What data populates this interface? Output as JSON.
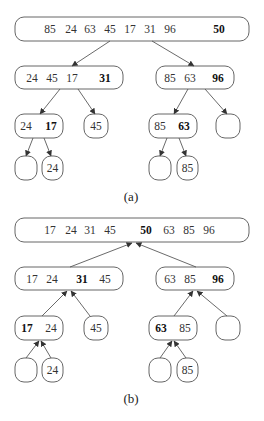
{
  "figure": {
    "type": "quick-sort-tree",
    "panels": [
      {
        "caption": "(a)",
        "direction": "down",
        "nodes": [
          {
            "id": "a-root",
            "box": [
              15,
              17,
              234,
              24
            ],
            "items": [
              {
                "v": "85",
                "x": 50
              },
              {
                "v": "24",
                "x": 71
              },
              {
                "v": "63",
                "x": 90
              },
              {
                "v": "45",
                "x": 110
              },
              {
                "v": "17",
                "x": 130
              },
              {
                "v": "31",
                "x": 150
              },
              {
                "v": "96",
                "x": 170
              },
              {
                "v": "50",
                "x": 219,
                "bold": true
              }
            ]
          },
          {
            "id": "a-L",
            "box": [
              15,
              66,
              108,
              23
            ],
            "items": [
              {
                "v": "24",
                "x": 32
              },
              {
                "v": "45",
                "x": 52
              },
              {
                "v": "17",
                "x": 72
              },
              {
                "v": "31",
                "x": 105,
                "bold": true
              }
            ]
          },
          {
            "id": "a-R",
            "box": [
              156,
              66,
              78,
              23
            ],
            "items": [
              {
                "v": "85",
                "x": 170
              },
              {
                "v": "63",
                "x": 190
              },
              {
                "v": "96",
                "x": 218,
                "bold": true
              }
            ]
          },
          {
            "id": "a-LL",
            "box": [
              15,
              114,
              48,
              24
            ],
            "items": [
              {
                "v": "24",
                "x": 26
              },
              {
                "v": "17",
                "x": 51,
                "bold": true
              }
            ]
          },
          {
            "id": "a-LR",
            "box": [
              84,
              114,
              24,
              24
            ],
            "items": [
              {
                "v": "45",
                "x": 96
              }
            ]
          },
          {
            "id": "a-RL",
            "box": [
              149,
              114,
              48,
              24
            ],
            "items": [
              {
                "v": "85",
                "x": 160
              },
              {
                "v": "63",
                "x": 184,
                "bold": true
              }
            ]
          },
          {
            "id": "a-RR",
            "box": [
              216,
              114,
              24,
              24
            ],
            "items": []
          },
          {
            "id": "a-LLL",
            "box": [
              15,
              156,
              22,
              24
            ],
            "items": []
          },
          {
            "id": "a-LLR",
            "box": [
              42,
              156,
              21,
              24
            ],
            "items": [
              {
                "v": "24",
                "x": 52.5
              }
            ]
          },
          {
            "id": "a-RLL",
            "box": [
              149,
              156,
              22,
              24
            ],
            "items": []
          },
          {
            "id": "a-RLR",
            "box": [
              177,
              156,
              21,
              24
            ],
            "items": [
              {
                "v": "85",
                "x": 187.5
              }
            ]
          }
        ],
        "edges": [
          {
            "from": [
              110,
              41
            ],
            "to": [
              72,
              66
            ]
          },
          {
            "from": [
              152,
              41
            ],
            "to": [
              194,
              66
            ]
          },
          {
            "from": [
              60,
              89
            ],
            "to": [
              40,
              114
            ]
          },
          {
            "from": [
              78,
              89
            ],
            "to": [
              95,
              114
            ]
          },
          {
            "from": [
              188,
              89
            ],
            "to": [
              174,
              114
            ]
          },
          {
            "from": [
              205,
              89
            ],
            "to": [
              227,
              114
            ]
          },
          {
            "from": [
              33,
              138
            ],
            "to": [
              26,
              156
            ]
          },
          {
            "from": [
              44,
              138
            ],
            "to": [
              51,
              156
            ]
          },
          {
            "from": [
              167,
              138
            ],
            "to": [
              160,
              156
            ]
          },
          {
            "from": [
              179,
              138
            ],
            "to": [
              186,
              156
            ]
          }
        ],
        "caption_pos": [
          131,
          196
        ]
      },
      {
        "caption": "(b)",
        "direction": "up",
        "nodes": [
          {
            "id": "b-root",
            "box": [
              15,
              218,
              234,
              24
            ],
            "items": [
              {
                "v": "17",
                "x": 50
              },
              {
                "v": "24",
                "x": 71
              },
              {
                "v": "31",
                "x": 90
              },
              {
                "v": "45",
                "x": 110
              },
              {
                "v": "50",
                "x": 146,
                "bold": true
              },
              {
                "v": "63",
                "x": 169
              },
              {
                "v": "85",
                "x": 189
              },
              {
                "v": "96",
                "x": 209
              }
            ]
          },
          {
            "id": "b-L",
            "box": [
              15,
              267,
              108,
              23
            ],
            "items": [
              {
                "v": "17",
                "x": 32
              },
              {
                "v": "24",
                "x": 52
              },
              {
                "v": "31",
                "x": 82,
                "bold": true
              },
              {
                "v": "45",
                "x": 105
              }
            ]
          },
          {
            "id": "b-R",
            "box": [
              156,
              267,
              78,
              23
            ],
            "items": [
              {
                "v": "63",
                "x": 170
              },
              {
                "v": "85",
                "x": 190
              },
              {
                "v": "96",
                "x": 218,
                "bold": true
              }
            ]
          },
          {
            "id": "b-LL",
            "box": [
              15,
              316,
              48,
              24
            ],
            "items": [
              {
                "v": "17",
                "x": 27,
                "bold": true
              },
              {
                "v": "24",
                "x": 51
              }
            ]
          },
          {
            "id": "b-LR",
            "box": [
              84,
              316,
              24,
              24
            ],
            "items": [
              {
                "v": "45",
                "x": 96
              }
            ]
          },
          {
            "id": "b-RL",
            "box": [
              149,
              316,
              48,
              24
            ],
            "items": [
              {
                "v": "63",
                "x": 161,
                "bold": true
              },
              {
                "v": "85",
                "x": 185
              }
            ]
          },
          {
            "id": "b-RR",
            "box": [
              216,
              316,
              24,
              24
            ],
            "items": []
          },
          {
            "id": "b-LLL",
            "box": [
              15,
              358,
              22,
              24
            ],
            "items": []
          },
          {
            "id": "b-LLR",
            "box": [
              42,
              358,
              21,
              24
            ],
            "items": [
              {
                "v": "24",
                "x": 52.5
              }
            ]
          },
          {
            "id": "b-RLL",
            "box": [
              149,
              358,
              22,
              24
            ],
            "items": []
          },
          {
            "id": "b-RLR",
            "box": [
              177,
              358,
              21,
              24
            ],
            "items": [
              {
                "v": "85",
                "x": 187.5
              }
            ]
          }
        ],
        "edges": [
          {
            "from": [
              70,
              267
            ],
            "to": [
              132,
              243
            ]
          },
          {
            "from": [
              196,
              267
            ],
            "to": [
              136,
              243
            ]
          },
          {
            "from": [
              42,
              316
            ],
            "to": [
              67,
              291
            ]
          },
          {
            "from": [
              90,
              316
            ],
            "to": [
              71,
              291
            ]
          },
          {
            "from": [
              174,
              316
            ],
            "to": [
              193,
              291
            ]
          },
          {
            "from": [
              227,
              316
            ],
            "to": [
              197,
              291
            ]
          },
          {
            "from": [
              26,
              358
            ],
            "to": [
              39,
              341
            ]
          },
          {
            "from": [
              51,
              358
            ],
            "to": [
              41,
              341
            ]
          },
          {
            "from": [
              160,
              358
            ],
            "to": [
              172,
              341
            ]
          },
          {
            "from": [
              186,
              358
            ],
            "to": [
              174,
              341
            ]
          }
        ],
        "caption_pos": [
          131,
          398
        ]
      }
    ]
  }
}
